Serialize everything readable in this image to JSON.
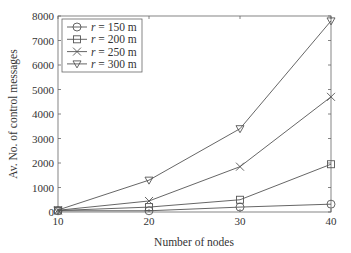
{
  "chart_data": {
    "type": "line",
    "title": "",
    "xlabel": "Number of nodes",
    "ylabel": "Av. No. of control messages",
    "x": [
      10,
      20,
      30,
      40
    ],
    "xticks": [
      "10",
      "20",
      "30",
      "40"
    ],
    "yticks": [
      "0",
      "1000",
      "2000",
      "3000",
      "4000",
      "5000",
      "6000",
      "7000",
      "8000"
    ],
    "xlim": [
      10,
      40
    ],
    "ylim": [
      0,
      8000
    ],
    "grid": false,
    "legend_position": "upper left",
    "series": [
      {
        "name": "r = 150 m",
        "marker": "circle",
        "values": [
          50,
          50,
          200,
          320
        ]
      },
      {
        "name": "r = 200 m",
        "marker": "square",
        "values": [
          60,
          200,
          500,
          1950
        ]
      },
      {
        "name": "r = 250 m",
        "marker": "x",
        "values": [
          70,
          450,
          1850,
          4700
        ]
      },
      {
        "name": "r = 300 m",
        "marker": "triangle-down",
        "values": [
          80,
          1300,
          3400,
          7800
        ]
      }
    ]
  },
  "colors": {
    "line": "#555555",
    "axis": "#666666",
    "text": "#333333"
  }
}
